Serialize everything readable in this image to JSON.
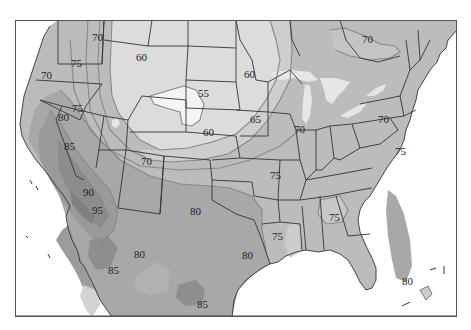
{
  "map": {
    "type": "isotherm",
    "region": "United States (contiguous) with northern Mexico and southern Canada",
    "frame": {
      "x": 15,
      "y": 20,
      "width": 442,
      "height": 297
    },
    "colors": {
      "background": "#ffffff",
      "ocean": "#ffffff",
      "frame": "#555555",
      "borders": "#333333",
      "isotherm_line": "#8a8a8a",
      "lake": "#e6e6e6",
      "band_55": "#f2f2f2",
      "band_60": "#dedede",
      "band_65": "#cfcfcf",
      "band_70": "#c2c2c2",
      "band_75": "#b4b4b4",
      "band_80": "#a8a8a8",
      "band_85": "#9a9a9a",
      "band_90": "#8c8c8c",
      "band_95": "#7e7e7e"
    },
    "labels": [
      {
        "text": "70",
        "x": 99,
        "y": 38
      },
      {
        "text": "75",
        "x": 77,
        "y": 64
      },
      {
        "text": "70",
        "x": 48,
        "y": 76
      },
      {
        "text": "60",
        "x": 142,
        "y": 58
      },
      {
        "text": "55",
        "x": 204,
        "y": 94
      },
      {
        "text": "60",
        "x": 247,
        "y": 75
      },
      {
        "text": "60",
        "x": 210,
        "y": 133
      },
      {
        "text": "65",
        "x": 253,
        "y": 120
      },
      {
        "text": "70",
        "x": 366,
        "y": 40
      },
      {
        "text": "70",
        "x": 297,
        "y": 130
      },
      {
        "text": "70",
        "x": 378,
        "y": 120
      },
      {
        "text": "75",
        "x": 75,
        "y": 109
      },
      {
        "text": "80",
        "x": 62,
        "y": 118
      },
      {
        "text": "85",
        "x": 70,
        "y": 147
      },
      {
        "text": "70",
        "x": 147,
        "y": 162
      },
      {
        "text": "75",
        "x": 398,
        "y": 152
      },
      {
        "text": "75",
        "x": 274,
        "y": 176
      },
      {
        "text": "90",
        "x": 89,
        "y": 193
      },
      {
        "text": "95",
        "x": 98,
        "y": 211
      },
      {
        "text": "80",
        "x": 195,
        "y": 212
      },
      {
        "text": "80",
        "x": 140,
        "y": 255
      },
      {
        "text": "85",
        "x": 113,
        "y": 271
      },
      {
        "text": "75",
        "x": 333,
        "y": 218
      },
      {
        "text": "75",
        "x": 276,
        "y": 237
      },
      {
        "text": "80",
        "x": 247,
        "y": 256
      },
      {
        "text": "85",
        "x": 202,
        "y": 305
      },
      {
        "text": "80",
        "x": 406,
        "y": 282
      }
    ],
    "isotherm_values": [
      55,
      60,
      65,
      70,
      75,
      80,
      85,
      90,
      95
    ]
  }
}
